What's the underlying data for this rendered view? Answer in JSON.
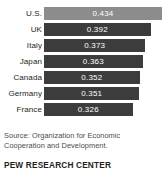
{
  "chart_data": {
    "type": "bar",
    "orientation": "horizontal",
    "title": "",
    "xlabel": "",
    "ylabel": "",
    "categories": [
      "U.S.",
      "UK",
      "Italy",
      "Japan",
      "Canada",
      "Germany",
      "France"
    ],
    "values": [
      0.434,
      0.392,
      0.373,
      0.363,
      0.352,
      0.351,
      0.326
    ],
    "value_labels": [
      "0.434",
      "0.392",
      "0.373",
      "0.363",
      "0.352",
      "0.351",
      "0.326"
    ],
    "xlim": [
      0,
      0.434
    ],
    "grid": false,
    "legend": false,
    "highlight_index": 0,
    "bar_color": "#3c3c3c",
    "highlight_color": "#8c8c8c",
    "value_label_color": "#ffffff"
  },
  "bars": [
    {
      "label": "U.S.",
      "value_label": "0.434",
      "width_pct": 100.0,
      "highlight": true
    },
    {
      "label": "UK",
      "value_label": "0.392",
      "width_pct": 78.0,
      "highlight": false
    },
    {
      "label": "Italy",
      "value_label": "0.373",
      "width_pct": 74.0,
      "highlight": false
    },
    {
      "label": "Japan",
      "value_label": "0.363",
      "width_pct": 71.0,
      "highlight": false
    },
    {
      "label": "Canada",
      "value_label": "0.352",
      "width_pct": 69.0,
      "highlight": false
    },
    {
      "label": "Germany",
      "value_label": "0.351",
      "width_pct": 69.0,
      "highlight": false
    },
    {
      "label": "France",
      "value_label": "0.326",
      "width_pct": 64.0,
      "highlight": false
    }
  ],
  "source": {
    "text": "Source: Organization for Economic Cooperation and Development."
  },
  "footer": {
    "brand": "PEW RESEARCH CENTER"
  }
}
